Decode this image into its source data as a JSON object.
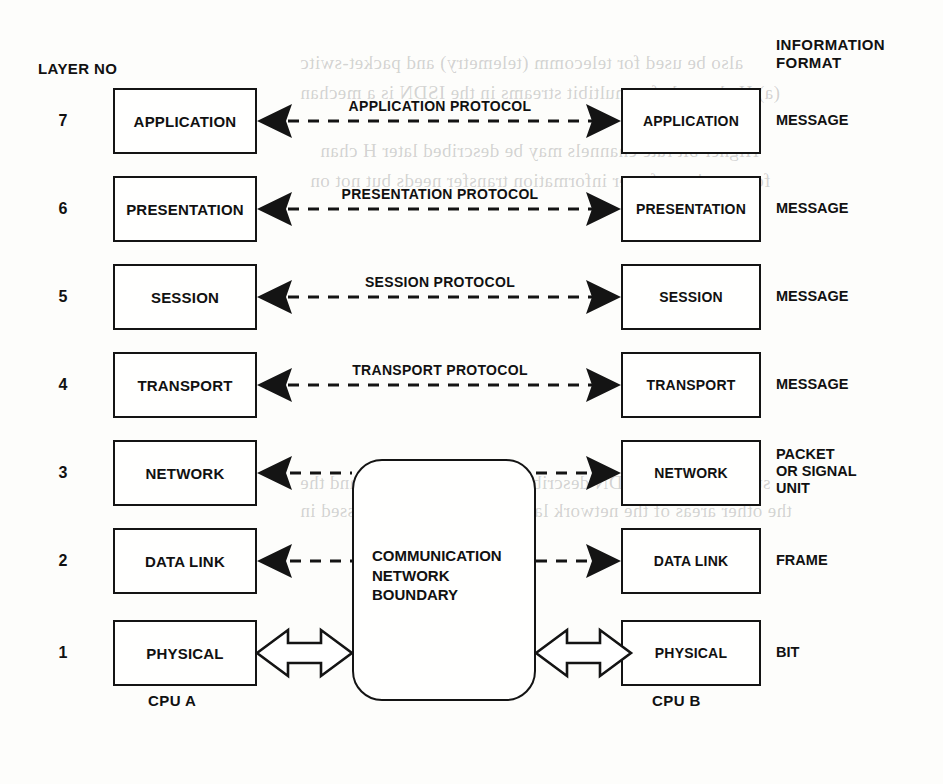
{
  "diagram": {
    "headers": {
      "layer_no": "LAYER NO",
      "information_format": "INFORMATION\nFORMAT"
    },
    "boundary": {
      "label": "COMMUNICATION\nNETWORK\nBOUNDARY"
    },
    "cpu_left": "CPU A",
    "cpu_right": "CPU B",
    "colors": {
      "ink": "#141414",
      "paper": "#fdfdfb"
    },
    "layers": [
      {
        "number": "7",
        "name": "APPLICATION",
        "peer_name": "APPLICATION",
        "protocol": "APPLICATION PROTOCOL",
        "format": "MESSAGE",
        "connector": "dashed-double-arrow"
      },
      {
        "number": "6",
        "name": "PRESENTATION",
        "peer_name": "PRESENTATION",
        "protocol": "PRESENTATION PROTOCOL",
        "format": "MESSAGE",
        "connector": "dashed-double-arrow"
      },
      {
        "number": "5",
        "name": "SESSION",
        "peer_name": "SESSION",
        "protocol": "SESSION PROTOCOL",
        "format": "MESSAGE",
        "connector": "dashed-double-arrow"
      },
      {
        "number": "4",
        "name": "TRANSPORT",
        "peer_name": "TRANSPORT",
        "protocol": "TRANSPORT PROTOCOL",
        "format": "MESSAGE",
        "connector": "dashed-double-arrow"
      },
      {
        "number": "3",
        "name": "NETWORK",
        "peer_name": "NETWORK",
        "protocol": "",
        "format": "PACKET\nOR SIGNAL\nUNIT",
        "connector": "dashed-to-boundary"
      },
      {
        "number": "2",
        "name": "DATA LINK",
        "peer_name": "DATA LINK",
        "protocol": "",
        "format": "FRAME",
        "connector": "dashed-to-boundary"
      },
      {
        "number": "1",
        "name": "PHYSICAL",
        "peer_name": "PHYSICAL",
        "protocol": "",
        "format": "BIT",
        "connector": "hollow-double-arrow"
      }
    ],
    "ghost_text": [
      "also be used for telecomm (telemetry) and packet-switc",
      "(a) H channels for multibit streams in the ISDN is a mechan",
      "Higher bit rate channels may be described later H chan",
      "for a variety of user information transfer needs but not on",
      "summary of the ISDN describing the user channels and the",
      "the other areas of the network layer. These can be accessed in"
    ]
  }
}
